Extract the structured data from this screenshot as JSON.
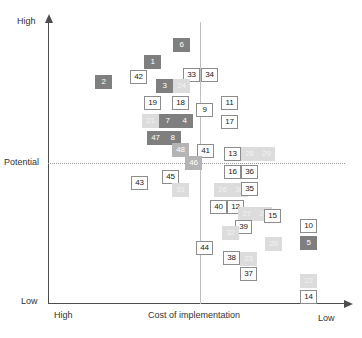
{
  "chart_data": {
    "type": "scatter",
    "title": "",
    "xlabel": "Cost of implementation",
    "ylabel": "",
    "x_axis": {
      "left_label": "High",
      "right_label": "Low"
    },
    "y_axis": {
      "top_label": "High",
      "bottom_label": "Low",
      "threshold_label": "Potential"
    },
    "grid": false,
    "legend": "none",
    "reference_lines": [
      {
        "name": "potential-threshold",
        "orientation": "horizontal",
        "label": "Potential",
        "style": "dotted"
      },
      {
        "name": "cost-midline",
        "orientation": "vertical",
        "label": "",
        "style": "solid"
      }
    ],
    "points": [
      {
        "label": "6",
        "x": 181,
        "y": 45,
        "shade": "dark"
      },
      {
        "label": "1",
        "x": 152,
        "y": 62,
        "shade": "dark"
      },
      {
        "label": "2",
        "x": 103,
        "y": 82,
        "shade": "dark"
      },
      {
        "label": "42",
        "x": 138,
        "y": 77,
        "shade": "white"
      },
      {
        "label": "33",
        "x": 191,
        "y": 75,
        "shade": "white"
      },
      {
        "label": "34",
        "x": 209,
        "y": 75,
        "shade": "white"
      },
      {
        "label": "3",
        "x": 164,
        "y": 86,
        "shade": "dark"
      },
      {
        "label": "24",
        "x": 181,
        "y": 86,
        "shade": "light"
      },
      {
        "label": "19",
        "x": 152,
        "y": 103,
        "shade": "white"
      },
      {
        "label": "18",
        "x": 180,
        "y": 103,
        "shade": "white"
      },
      {
        "label": "9",
        "x": 204,
        "y": 110,
        "shade": "white"
      },
      {
        "label": "11",
        "x": 229,
        "y": 103,
        "shade": "white"
      },
      {
        "label": "17",
        "x": 229,
        "y": 122,
        "shade": "white"
      },
      {
        "label": "21",
        "x": 150,
        "y": 121,
        "shade": "light"
      },
      {
        "label": "7",
        "x": 167,
        "y": 121,
        "shade": "dark"
      },
      {
        "label": "4",
        "x": 184,
        "y": 121,
        "shade": "dark"
      },
      {
        "label": "47",
        "x": 155,
        "y": 138,
        "shade": "dark"
      },
      {
        "label": "8",
        "x": 172,
        "y": 138,
        "shade": "dark"
      },
      {
        "label": "48",
        "x": 180,
        "y": 150,
        "shade": "mid"
      },
      {
        "label": "41",
        "x": 205,
        "y": 151,
        "shade": "white"
      },
      {
        "label": "13",
        "x": 232,
        "y": 154,
        "shade": "white"
      },
      {
        "label": "28",
        "x": 249,
        "y": 154,
        "shade": "light"
      },
      {
        "label": "29",
        "x": 266,
        "y": 154,
        "shade": "light"
      },
      {
        "label": "46",
        "x": 193,
        "y": 163,
        "shade": "mid"
      },
      {
        "label": "16",
        "x": 232,
        "y": 172,
        "shade": "white"
      },
      {
        "label": "36",
        "x": 249,
        "y": 172,
        "shade": "white"
      },
      {
        "label": "45",
        "x": 170,
        "y": 177,
        "shade": "white"
      },
      {
        "label": "43",
        "x": 139,
        "y": 183,
        "shade": "white"
      },
      {
        "label": "26",
        "x": 222,
        "y": 190,
        "shade": "light"
      },
      {
        "label": "30",
        "x": 239,
        "y": 190,
        "shade": "light"
      },
      {
        "label": "35",
        "x": 249,
        "y": 189,
        "shade": "white"
      },
      {
        "label": "31",
        "x": 180,
        "y": 190,
        "shade": "light"
      },
      {
        "label": "40",
        "x": 218,
        "y": 207,
        "shade": "white"
      },
      {
        "label": "12",
        "x": 235,
        "y": 207,
        "shade": "white"
      },
      {
        "label": "27",
        "x": 246,
        "y": 214,
        "shade": "light"
      },
      {
        "label": "25",
        "x": 263,
        "y": 214,
        "shade": "light"
      },
      {
        "label": "15",
        "x": 272,
        "y": 216,
        "shade": "white"
      },
      {
        "label": "10",
        "x": 308,
        "y": 226,
        "shade": "white"
      },
      {
        "label": "39",
        "x": 243,
        "y": 227,
        "shade": "white"
      },
      {
        "label": "32",
        "x": 230,
        "y": 233,
        "shade": "light"
      },
      {
        "label": "5",
        "x": 308,
        "y": 243,
        "shade": "dark"
      },
      {
        "label": "20",
        "x": 273,
        "y": 244,
        "shade": "light"
      },
      {
        "label": "44",
        "x": 204,
        "y": 248,
        "shade": "white"
      },
      {
        "label": "38",
        "x": 231,
        "y": 258,
        "shade": "white"
      },
      {
        "label": "23",
        "x": 248,
        "y": 259,
        "shade": "light"
      },
      {
        "label": "37",
        "x": 248,
        "y": 274,
        "shade": "white"
      },
      {
        "label": "22",
        "x": 308,
        "y": 281,
        "shade": "light"
      },
      {
        "label": "14",
        "x": 308,
        "y": 297,
        "shade": "white"
      }
    ]
  }
}
